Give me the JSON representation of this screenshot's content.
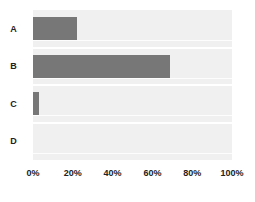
{
  "chart_data": {
    "type": "bar",
    "orientation": "horizontal",
    "title": "",
    "subtitle": "",
    "xlabel": "",
    "ylabel": "",
    "categories": [
      "A",
      "B",
      "C",
      "D"
    ],
    "values": [
      22,
      69,
      3,
      0
    ],
    "value_suffix": "%",
    "xlim": [
      0,
      100
    ],
    "xticks": [
      0,
      20,
      40,
      60,
      80,
      100
    ],
    "xtick_labels": [
      "0%",
      "20%",
      "40%",
      "60%",
      "80%",
      "100%"
    ],
    "grid": "horizontal",
    "legend": "none",
    "series": [
      {
        "name": "",
        "values": [
          22,
          69,
          3,
          0
        ]
      }
    ],
    "colors": {
      "bar": "#777777",
      "plot_background": "#f0f0f0",
      "gridline": "#ffffff",
      "figure_background": "#ffffff",
      "text": "#222222"
    }
  }
}
